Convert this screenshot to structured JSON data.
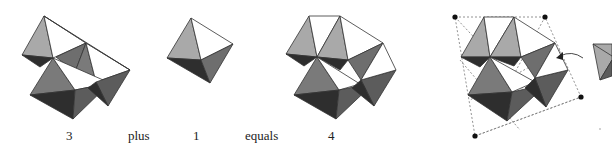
{
  "figure": {
    "equation_labels": {
      "term1": "3",
      "op1": "plus",
      "term2": "1",
      "op2": "equals",
      "result": "4"
    },
    "shading": {
      "light": "#a9a9a9",
      "white": "#ffffff",
      "mid": "#6e6e6e",
      "dark": "#2e2e2e",
      "edge": "#333333",
      "dashed": "#777777",
      "dot": "#111111"
    },
    "panels": [
      {
        "name": "cluster-of-3-octahedra",
        "count": 3
      },
      {
        "name": "single-octahedron",
        "count": 1
      },
      {
        "name": "cluster-of-4-octahedra",
        "count": 4
      },
      {
        "name": "tetrahedral-frame-with-4-octahedra",
        "corner_dots": 4,
        "has_arrow": true
      }
    ]
  }
}
